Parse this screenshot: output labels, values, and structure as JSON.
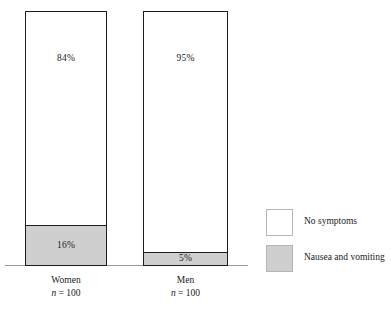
{
  "chart_data": {
    "type": "bar",
    "subtype": "stacked-100-percent",
    "title": "",
    "subtitle": "",
    "xlabel": "",
    "ylabel": "",
    "ylim": [
      0,
      100
    ],
    "grid": false,
    "categories": [
      "Women",
      "Men"
    ],
    "category_sublabels": [
      "n = 100",
      "n = 100"
    ],
    "category_n_prefix": "n",
    "category_n_value": "= 100",
    "series": [
      {
        "name": "No symptoms",
        "color": "#ffffff",
        "values": [
          84,
          95
        ],
        "labels": [
          "84%",
          "95%"
        ]
      },
      {
        "name": "Nausea and vomiting",
        "color": "#cfcfcf",
        "values": [
          16,
          5
        ],
        "labels": [
          "16%",
          "5%"
        ]
      }
    ],
    "legend": {
      "position": "right",
      "entries": [
        {
          "label": "No symptoms",
          "swatch": "white"
        },
        {
          "label": "Nausea and vomiting",
          "swatch": "gray"
        }
      ]
    },
    "colors": {
      "no_symptoms": "#ffffff",
      "nausea_and_vomiting": "#cfcfcf",
      "bar_outline": "#1c1c1c",
      "axis_line": "#9b9b9b",
      "text": "#1a1a1a"
    }
  }
}
